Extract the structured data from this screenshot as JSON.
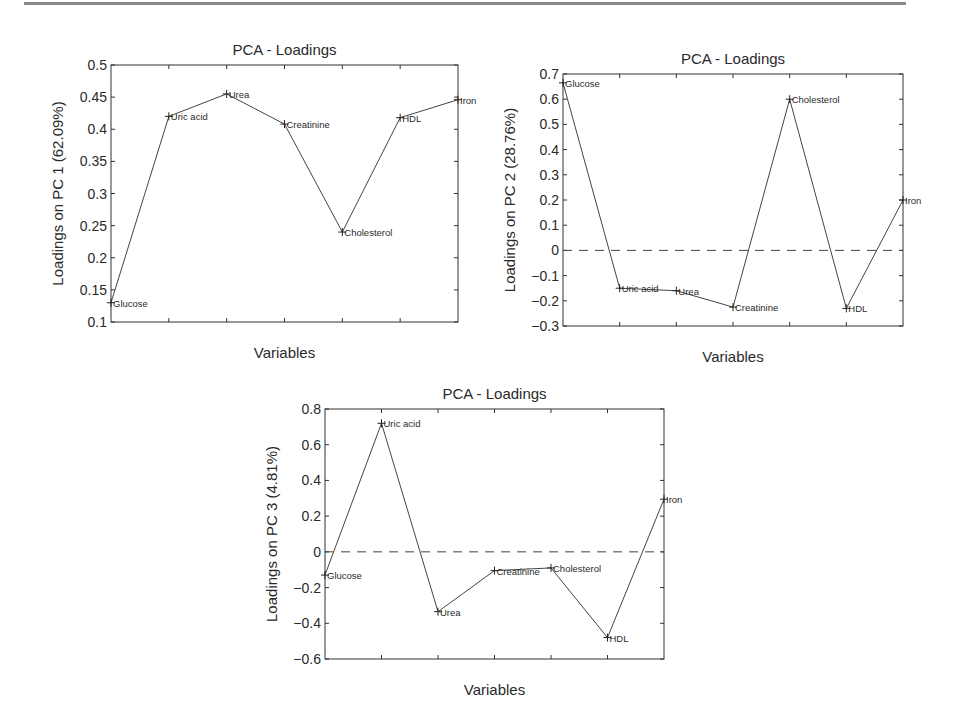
{
  "figure": {
    "variables": [
      "Glucose",
      "Uric acid",
      "Urea",
      "Creatinine",
      "Cholesterol",
      "HDL",
      "Iron"
    ]
  },
  "chart_data": [
    {
      "type": "line",
      "title": "PCA - Loadings",
      "xlabel": "Variables",
      "ylabel": "Loadings on PC 1 (62.09%)",
      "categories": [
        "Glucose",
        "Uric acid",
        "Urea",
        "Creatinine",
        "Cholesterol",
        "HDL",
        "Iron"
      ],
      "values": [
        0.13,
        0.42,
        0.455,
        0.408,
        0.24,
        0.418,
        0.446
      ],
      "ylim": [
        0.1,
        0.5
      ],
      "yticks": [
        0.1,
        0.15,
        0.2,
        0.25,
        0.3,
        0.35,
        0.4,
        0.45,
        0.5
      ],
      "ytick_labels": [
        "0.1",
        "0.15",
        "0.2",
        "0.25",
        "0.3",
        "0.35",
        "0.4",
        "0.45",
        "0.5"
      ],
      "zero_line": false,
      "grid": false,
      "box": {
        "left": 111,
        "top": 65,
        "right": 458,
        "bottom": 322
      }
    },
    {
      "type": "line",
      "title": "PCA - Loadings",
      "xlabel": "Variables",
      "ylabel": "Loadings on PC 2 (28.76%)",
      "categories": [
        "Glucose",
        "Uric acid",
        "Urea",
        "Creatinine",
        "Cholesterol",
        "HDL",
        "Iron"
      ],
      "values": [
        0.665,
        -0.15,
        -0.16,
        -0.225,
        0.6,
        -0.23,
        0.2
      ],
      "ylim": [
        -0.3,
        0.7
      ],
      "yticks": [
        -0.3,
        -0.2,
        -0.1,
        0,
        0.1,
        0.2,
        0.3,
        0.4,
        0.5,
        0.6,
        0.7
      ],
      "ytick_labels": [
        "−0.3",
        "−0.2",
        "−0.1",
        "0",
        "0.1",
        "0.2",
        "0.3",
        "0.4",
        "0.5",
        "0.6",
        "0.7"
      ],
      "zero_line": true,
      "grid": false,
      "box": {
        "left": 563,
        "top": 74,
        "right": 903,
        "bottom": 326
      }
    },
    {
      "type": "line",
      "title": "PCA - Loadings",
      "xlabel": "Variables",
      "ylabel": "Loadings on PC 3 (4.81%)",
      "categories": [
        "Glucose",
        "Uric acid",
        "Urea",
        "Creatinine",
        "Cholesterol",
        "HDL",
        "Iron"
      ],
      "values": [
        -0.13,
        0.72,
        -0.335,
        -0.105,
        -0.09,
        -0.48,
        0.295
      ],
      "ylim": [
        -0.6,
        0.8
      ],
      "yticks": [
        -0.6,
        -0.4,
        -0.2,
        0,
        0.2,
        0.4,
        0.6,
        0.8
      ],
      "ytick_labels": [
        "−0.6",
        "−0.4",
        "−0.2",
        "0",
        "0.2",
        "0.4",
        "0.6",
        "0.8"
      ],
      "zero_line": true,
      "grid": false,
      "box": {
        "left": 325,
        "top": 409,
        "right": 664,
        "bottom": 659
      }
    }
  ]
}
